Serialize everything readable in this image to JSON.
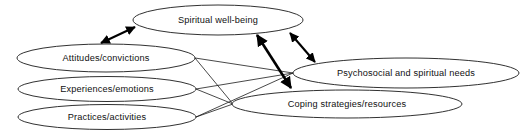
{
  "diagram": {
    "type": "ellipse-node-link-diagram",
    "canvas": {
      "width": 526,
      "height": 133,
      "background": "#ffffff"
    },
    "stroke_color": "#1a1a1a",
    "text_color": "#111111",
    "nodes": [
      {
        "id": "spiritual-well-being",
        "label": "Spiritual well-being",
        "cx": 218,
        "cy": 20,
        "rx": 85,
        "ry": 15
      },
      {
        "id": "attitudes-convictions",
        "label": "Attitudes/convictions",
        "cx": 106,
        "cy": 58,
        "rx": 89,
        "ry": 14
      },
      {
        "id": "experiences-emotions",
        "label": "Experiences/emotions",
        "cx": 107,
        "cy": 89,
        "rx": 89,
        "ry": 12.5
      },
      {
        "id": "practices-activities",
        "label": "Practices/activities",
        "cx": 107,
        "cy": 117,
        "rx": 89,
        "ry": 12.5
      },
      {
        "id": "psychosocial-spiritual-needs",
        "label": "Psychosocial and spiritual needs",
        "cx": 406,
        "cy": 73,
        "rx": 113,
        "ry": 15
      },
      {
        "id": "coping-strategies-resources",
        "label": "Coping strategies/resources",
        "cx": 347,
        "cy": 104,
        "rx": 115,
        "ry": 14
      }
    ],
    "links": [
      {
        "from": "attitudes-convictions",
        "to": "psychosocial-spiritual-needs",
        "style": "plain"
      },
      {
        "from": "attitudes-convictions",
        "to": "coping-strategies-resources",
        "style": "plain"
      },
      {
        "from": "experiences-emotions",
        "to": "psychosocial-spiritual-needs",
        "style": "plain"
      },
      {
        "from": "experiences-emotions",
        "to": "coping-strategies-resources",
        "style": "plain"
      },
      {
        "from": "practices-activities",
        "to": "psychosocial-spiritual-needs",
        "style": "plain"
      }
    ],
    "arrows": [
      {
        "id": "arrow-attitudes-wellbeing",
        "from": "attitudes-convictions",
        "to": "spiritual-well-being",
        "double_headed": true,
        "x1": 101,
        "y1": 43,
        "x2": 135,
        "y2": 27
      },
      {
        "id": "arrow-wellbeing-coping",
        "from": "spiritual-well-being",
        "to": "coping-strategies-resources",
        "double_headed": true,
        "x1": 256,
        "y1": 34,
        "x2": 292,
        "y2": 89
      },
      {
        "id": "arrow-wellbeing-needs",
        "from": "spiritual-well-being",
        "to": "psychosocial-spiritual-needs",
        "double_headed": true,
        "x1": 289,
        "y1": 32,
        "x2": 316,
        "y2": 63
      }
    ]
  }
}
